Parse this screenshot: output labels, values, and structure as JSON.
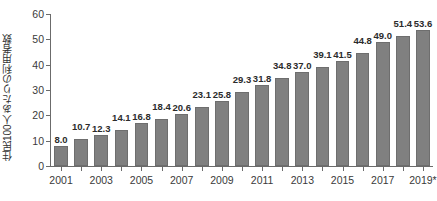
{
  "chart_data": {
    "type": "bar",
    "title": "",
    "subtitle": "",
    "xlabel": "",
    "ylabel": "住民100人あたりの利用者数",
    "ylim": [
      0,
      60
    ],
    "ytick_step": 10,
    "yticks": [
      "0",
      "10",
      "20",
      "30",
      "40",
      "50",
      "60"
    ],
    "grid": false,
    "legend": null,
    "bar_color": "#808080",
    "bar_edge_color": "#6e6e6e",
    "axis_color": "#6b6b6b",
    "text_color": "#3a3a3a",
    "categories": [
      "2001",
      "2002",
      "2003",
      "2004",
      "2005",
      "2006",
      "2007",
      "2008",
      "2009",
      "2010",
      "2011",
      "2012",
      "2013",
      "2014",
      "2015",
      "2016",
      "2017",
      "2018",
      "2019*"
    ],
    "xtick_labels_shown": [
      "2001",
      "2003",
      "2005",
      "2007",
      "2009",
      "2011",
      "2013",
      "2015",
      "2017",
      "2019*"
    ],
    "values": [
      8.0,
      10.7,
      12.3,
      14.1,
      16.8,
      18.4,
      20.6,
      23.1,
      25.8,
      29.3,
      31.8,
      34.8,
      37.0,
      39.1,
      41.5,
      44.8,
      49.0,
      51.4,
      53.6
    ],
    "value_labels": [
      "8.0",
      "10.7",
      "12.3",
      "14.1",
      "16.8",
      "18.4",
      "20.6",
      "23.1",
      "25.8",
      "29.3",
      "31.8",
      "34.8",
      "37.0",
      "39.1",
      "41.5",
      "44.8",
      "49.0",
      "51.4",
      "53.6"
    ],
    "annotations": {
      "asterisk_note": "2019*"
    }
  }
}
